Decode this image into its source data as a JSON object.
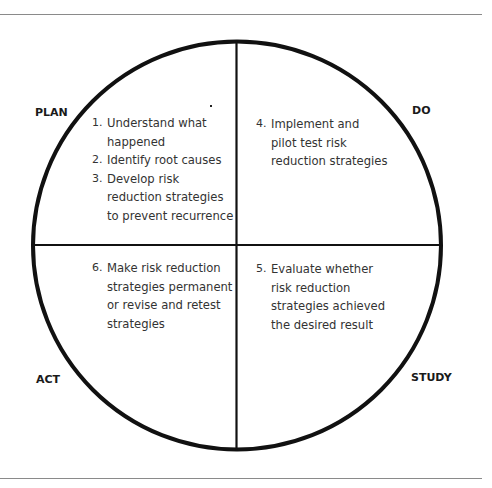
{
  "diagram": {
    "type": "PDSA cycle",
    "phases": {
      "plan": {
        "label": "PLAN"
      },
      "do": {
        "label": "DO"
      },
      "study": {
        "label": "STUDY"
      },
      "act": {
        "label": "ACT"
      }
    },
    "quadrants": {
      "plan": {
        "steps": [
          {
            "num": "1.",
            "text": "Understand what happened",
            "lines": [
              "Understand what",
              "happened"
            ]
          },
          {
            "num": "2.",
            "text": "Identify root causes",
            "lines": [
              "Identify root causes"
            ]
          },
          {
            "num": "3.",
            "text": "Develop risk reduction strategies to prevent recurrence",
            "lines": [
              "Develop risk",
              "reduction strategies",
              "to prevent recurrence"
            ]
          }
        ]
      },
      "do": {
        "steps": [
          {
            "num": "4.",
            "text": "Implement and pilot test risk reduction strategies",
            "lines": [
              "Implement and",
              "pilot test risk",
              "reduction strategies"
            ]
          }
        ]
      },
      "study": {
        "steps": [
          {
            "num": "5.",
            "text": "Evaluate whether risk reduction strategies achieved the desired result",
            "lines": [
              "Evaluate whether",
              "risk reduction",
              "strategies achieved",
              "the desired result"
            ]
          }
        ]
      },
      "act": {
        "steps": [
          {
            "num": "6.",
            "text": "Make risk reduction strategies permanent or revise and retest strategies",
            "lines": [
              "Make risk reduction",
              "strategies permanent",
              "or revise and retest",
              "strategies"
            ]
          }
        ]
      }
    },
    "colors": {
      "stroke": "#111111",
      "rule": "#8a8a8a",
      "text": "#333333"
    }
  }
}
